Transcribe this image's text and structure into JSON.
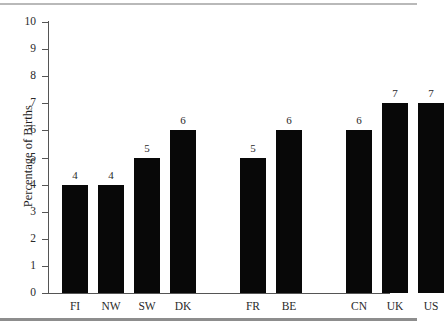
{
  "chart_data": {
    "type": "bar",
    "title": "",
    "xlabel": "",
    "ylabel": "Percentage of Births",
    "categories": [
      "FI",
      "NW",
      "SW",
      "DK",
      "FR",
      "BE",
      "CN",
      "UK",
      "US"
    ],
    "values": [
      4,
      4,
      5,
      6,
      5,
      6,
      6,
      7,
      7
    ],
    "groups": [
      {
        "categories": [
          "FI",
          "NW",
          "SW",
          "DK"
        ],
        "values": [
          4,
          4,
          5,
          6
        ]
      },
      {
        "categories": [
          "FR",
          "BE"
        ],
        "values": [
          5,
          6
        ]
      },
      {
        "categories": [
          "CN",
          "UK",
          "US"
        ],
        "values": [
          6,
          7,
          7
        ]
      }
    ],
    "ylim": [
      0,
      10
    ],
    "ytick_labels": [
      "0",
      "1",
      "2",
      "3",
      "4",
      "5",
      "6",
      "7",
      "8",
      "9",
      "10"
    ],
    "ytick_values": [
      0,
      1,
      2,
      3,
      4,
      5,
      6,
      7,
      8,
      9,
      10
    ],
    "grid": false,
    "legend": null,
    "bar_color": "#080808",
    "axis_color": "#555555",
    "background_color": "#ffffff",
    "show_value_labels": true
  },
  "figure": {
    "top_rule_color": "#b9b9b9",
    "bottom_rule_color": "#8d8d8d"
  }
}
